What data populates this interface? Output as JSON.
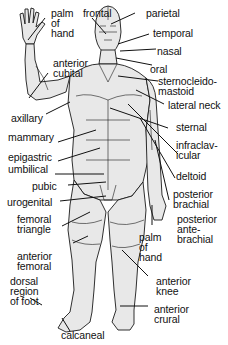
{
  "diagram": {
    "labels": {
      "palm_of_hand_top": "palm\nof\nhand",
      "frontal": "frontal",
      "parietal": "parietal",
      "temporal": "temporal",
      "nasal": "nasal",
      "oral": "oral",
      "anterior_cubital": "anterior\ncubital",
      "sternocleidomastoid": "sternocleido-\nmastoid",
      "lateral_neck": "lateral neck",
      "axillary": "axillary",
      "sternal": "sternal",
      "mammary": "mammary",
      "infraclavicular": "infraclav-\nicular",
      "epigastric": "epigastric",
      "umbilical": "umbilical",
      "deltoid": "deltoid",
      "pubic": "pubic",
      "posterior_brachial": "posterior\nbrachial",
      "urogenital": "urogenital",
      "posterior_antebrachial": "posterior\nante-\nbrachial",
      "femoral_triangle": "femoral\ntriangle",
      "palm_of_hand_bottom": "palm\nof\nhand",
      "anterior_femoral": "anterior\nfemoral",
      "anterior_knee": "anterior\nknee",
      "dorsal_region_of_foot": "dorsal\nregion\nof foot",
      "anterior_crural": "anterior\ncrural",
      "calcaneal": "calcaneal"
    },
    "colors": {
      "outline": "#1a1a1a",
      "skin": "#e6e6e6",
      "background": "#ffffff"
    }
  }
}
